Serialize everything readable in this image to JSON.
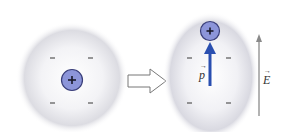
{
  "diagram": {
    "left_atom": {
      "state": "unpolarized",
      "nucleus_symbol": "+",
      "electron_symbols": [
        "–",
        "–",
        "–",
        "–"
      ]
    },
    "transition_arrow": "hollow-right-arrow",
    "right_atom": {
      "state": "polarized",
      "nucleus_symbol": "+",
      "electron_symbols": [
        "–",
        "–",
        "–",
        "–"
      ],
      "dipole_label": "p",
      "dipole_vector_mark": "→"
    },
    "field": {
      "label": "E",
      "vector_mark": "→",
      "direction": "up"
    },
    "colors": {
      "cloud": "#d9d9df",
      "nucleus_fill": "#8c95d9",
      "nucleus_stroke": "#3a3f7a",
      "dipole_arrow": "#2a4fb0",
      "field_arrow": "#8a8a8a",
      "minus": "#444444"
    }
  }
}
